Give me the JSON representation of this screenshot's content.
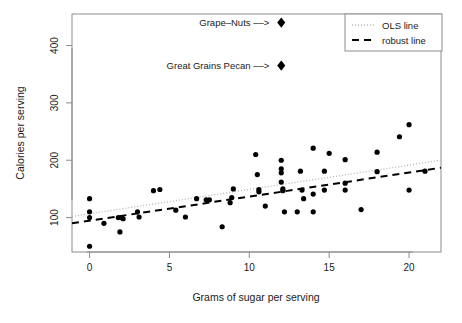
{
  "chart_data": {
    "type": "scatter",
    "title": "",
    "xlabel": "Grams of sugar per serving",
    "ylabel": "Calories per serving",
    "xlim": [
      -1.1,
      22.0
    ],
    "ylim": [
      40,
      455
    ],
    "xticks": [
      0,
      5,
      10,
      15,
      20
    ],
    "xticklabels": [
      "0",
      "5",
      "10",
      "15",
      "20"
    ],
    "yticks": [
      100,
      200,
      300,
      400
    ],
    "yticklabels": [
      "100",
      "200",
      "300",
      "400"
    ],
    "grid": false,
    "legend_position": "top-right",
    "points": [
      {
        "x": 0.0,
        "y": 50
      },
      {
        "x": 0.0,
        "y": 100
      },
      {
        "x": 0.0,
        "y": 110
      },
      {
        "x": 0.0,
        "y": 133
      },
      {
        "x": 0.9,
        "y": 90
      },
      {
        "x": 1.8,
        "y": 100
      },
      {
        "x": 2.0,
        "y": 100
      },
      {
        "x": 2.1,
        "y": 98
      },
      {
        "x": 1.9,
        "y": 75
      },
      {
        "x": 3.0,
        "y": 110
      },
      {
        "x": 3.1,
        "y": 101
      },
      {
        "x": 4.0,
        "y": 147
      },
      {
        "x": 4.4,
        "y": 149
      },
      {
        "x": 5.4,
        "y": 113
      },
      {
        "x": 6.0,
        "y": 101
      },
      {
        "x": 6.7,
        "y": 133
      },
      {
        "x": 7.3,
        "y": 131
      },
      {
        "x": 7.5,
        "y": 131
      },
      {
        "x": 8.3,
        "y": 84
      },
      {
        "x": 8.8,
        "y": 126
      },
      {
        "x": 8.9,
        "y": 135
      },
      {
        "x": 9.0,
        "y": 150
      },
      {
        "x": 10.4,
        "y": 210
      },
      {
        "x": 10.5,
        "y": 175
      },
      {
        "x": 10.6,
        "y": 149
      },
      {
        "x": 10.6,
        "y": 145
      },
      {
        "x": 11.0,
        "y": 120
      },
      {
        "x": 12.0,
        "y": 200
      },
      {
        "x": 12.0,
        "y": 185
      },
      {
        "x": 12.0,
        "y": 178
      },
      {
        "x": 12.0,
        "y": 162
      },
      {
        "x": 12.1,
        "y": 150
      },
      {
        "x": 12.1,
        "y": 147
      },
      {
        "x": 12.2,
        "y": 110
      },
      {
        "x": 13.2,
        "y": 181
      },
      {
        "x": 13.3,
        "y": 148
      },
      {
        "x": 13.4,
        "y": 133
      },
      {
        "x": 13.0,
        "y": 110
      },
      {
        "x": 14.0,
        "y": 221
      },
      {
        "x": 14.0,
        "y": 141
      },
      {
        "x": 14.0,
        "y": 110
      },
      {
        "x": 14.7,
        "y": 181
      },
      {
        "x": 14.7,
        "y": 148
      },
      {
        "x": 15.0,
        "y": 212
      },
      {
        "x": 16.0,
        "y": 201
      },
      {
        "x": 16.0,
        "y": 160
      },
      {
        "x": 16.0,
        "y": 148
      },
      {
        "x": 17.0,
        "y": 114
      },
      {
        "x": 18.0,
        "y": 214
      },
      {
        "x": 18.0,
        "y": 180
      },
      {
        "x": 19.4,
        "y": 241
      },
      {
        "x": 20.0,
        "y": 262
      },
      {
        "x": 20.0,
        "y": 148
      },
      {
        "x": 21.0,
        "y": 181
      }
    ],
    "highlight_points": [
      {
        "label": "Grape-Nuts",
        "x": 12.0,
        "y": 440,
        "marker": "diamond"
      },
      {
        "label": "Great Grains Pecan",
        "x": 12.0,
        "y": 365,
        "marker": "diamond"
      }
    ],
    "annotations": [
      {
        "text": "Grape–Nuts ––>",
        "x": 12.0,
        "y": 440,
        "align": "right"
      },
      {
        "text": "Great Grains Pecan ––>",
        "x": 12.0,
        "y": 365,
        "align": "right"
      }
    ],
    "series": [
      {
        "name": "OLS line",
        "type": "line",
        "style": "dotted",
        "color": "#b4b4b4",
        "x": [
          -1.1,
          22.0
        ],
        "y": [
          102,
          200
        ]
      },
      {
        "name": "robust line",
        "type": "line",
        "style": "dashed",
        "color": "#000000",
        "x": [
          -1.1,
          22.0
        ],
        "y": [
          90,
          187
        ]
      }
    ],
    "legend": [
      {
        "label": "OLS line",
        "style": "dotted",
        "color": "#b4b4b4"
      },
      {
        "label": "robust line",
        "style": "dashed",
        "color": "#000000"
      }
    ]
  },
  "colors": {
    "background": "#ffffff",
    "frame": "#8c8c8c",
    "point": "#000000",
    "ols": "#b4b4b4",
    "robust": "#000000",
    "text": "#1a1a1a"
  }
}
